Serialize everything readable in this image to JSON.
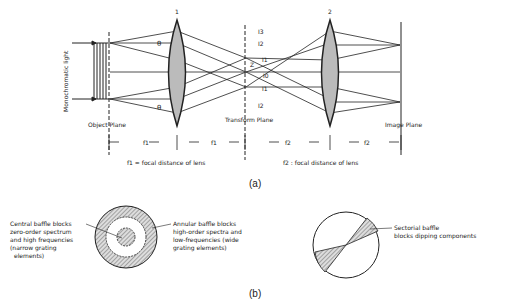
{
  "figure_a": {
    "caption": "(a)",
    "source_label": "Monochromatic light",
    "object_plane": "Object Plane",
    "transform_plane": "Transform Plane",
    "image_plane": "Image Plane",
    "lens1_label": "1",
    "lens2_label": "2",
    "theta": "θ",
    "orders": {
      "i3": "I3",
      "i2_top": "I2",
      "i1_top": "I1",
      "i0": "I0",
      "i1_bot": "I1",
      "i2_bot": "I2",
      "z": "Z"
    },
    "distances": {
      "f1a": "f1",
      "f1b": "f1",
      "f2a": "f2",
      "f2b": "f2"
    },
    "legend_f1": "f1 = focal distance of lens",
    "legend_f2": "f2 : focal distance of lens"
  },
  "figure_b": {
    "caption": "(b)",
    "central_baffle": [
      "Central baffle blocks",
      "zero-order spectrum",
      "and high frequencies",
      "(narrow grating",
      "elements)"
    ],
    "annular_baffle": [
      "Annular baffle blocks",
      "high-order spectra and",
      "low-frequencies (wide",
      "grating elements)"
    ],
    "sectorial_baffle": [
      "Sectorial baffle",
      "blocks dipping components"
    ]
  }
}
